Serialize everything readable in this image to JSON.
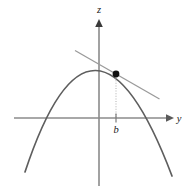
{
  "figure": {
    "type": "math-diagram",
    "background": "#ffffff",
    "curve_color": "#555555",
    "axis_color": "#888888",
    "tangent_color": "#999999",
    "point_color": "#000000",
    "dotted_color": "#bbbbbb",
    "labels": {
      "vertical_axis": "z",
      "horizontal_axis": "y",
      "abscissa": "b"
    },
    "geometry": {
      "origin": [
        99,
        118
      ],
      "vertical_axis": {
        "x": 99,
        "top": 22,
        "bottom": 186,
        "arrow": "up"
      },
      "horizontal_axis": {
        "y": 118,
        "left": 14,
        "right": 172,
        "arrow": "right"
      },
      "parabola": {
        "vertex": [
          93,
          68
        ],
        "left_end": [
          25,
          172
        ],
        "right_end": [
          172,
          176
        ],
        "left_root": [
          51,
          118
        ],
        "right_root": [
          140,
          118
        ]
      },
      "tangent": {
        "from": [
          75,
          51
        ],
        "to": [
          159,
          99
        ]
      },
      "point": [
        116,
        74
      ],
      "drop_line": {
        "from": [
          116,
          74
        ],
        "to": [
          116,
          118
        ]
      },
      "tick": {
        "x": 116,
        "y": 118
      }
    },
    "label_positions": {
      "z": [
        93,
        3
      ],
      "y": [
        176,
        110
      ],
      "b": [
        111,
        121
      ]
    }
  }
}
